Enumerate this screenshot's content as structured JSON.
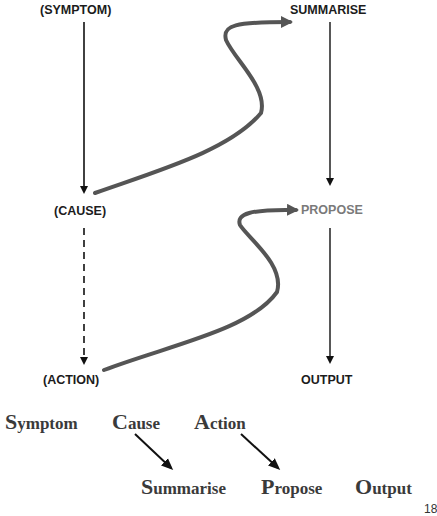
{
  "left_column": {
    "symptom": "(SYMPTOM)",
    "cause": "(CAUSE)",
    "action": "(ACTION)"
  },
  "right_column": {
    "summarise": "SUMMARISE",
    "propose": "PROPOSE",
    "output": "OUTPUT"
  },
  "mnemonic_top": [
    {
      "initial": "S",
      "rest": "ymptom"
    },
    {
      "initial": "C",
      "rest": "ause"
    },
    {
      "initial": "A",
      "rest": "ction"
    }
  ],
  "mnemonic_bottom": [
    {
      "initial": "S",
      "rest": "ummarise"
    },
    {
      "initial": "P",
      "rest": "ropose"
    },
    {
      "initial": "O",
      "rest": "utput"
    }
  ],
  "page_number": "18",
  "colors": {
    "label": "#1c1c1c",
    "highlight_label": "#7a7a7a",
    "curve_arrow": "#555555",
    "line": "#111111",
    "serif_text": "#3a3a3a"
  }
}
